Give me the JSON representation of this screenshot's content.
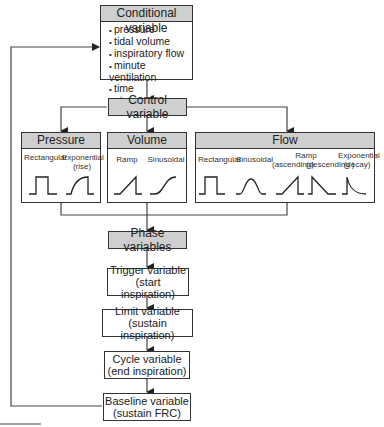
{
  "conditional": {
    "title": "Conditional variable",
    "items": [
      "pressure",
      "tidal volume",
      "inspiratory flow",
      "minute ventilation",
      "time",
      "etc."
    ]
  },
  "control": {
    "title": "Control variable"
  },
  "pressure": {
    "title": "Pressure",
    "waves": [
      {
        "label": "Rectangular",
        "shape": "rectangular"
      },
      {
        "label": "Exponential\n(rise)",
        "shape": "exponential-rise"
      }
    ]
  },
  "volume": {
    "title": "Volume",
    "waves": [
      {
        "label": "Ramp",
        "shape": "ramp"
      },
      {
        "label": "Sinusoidal",
        "shape": "sinusoidal"
      }
    ]
  },
  "flow": {
    "title": "Flow",
    "waves": [
      {
        "label": "Rectangular",
        "shape": "rectangular"
      },
      {
        "label": "Sinusoidal",
        "shape": "sinusoidal"
      },
      {
        "label": "Ramp",
        "shape": "ramp-header"
      },
      {
        "label": "(ascending)",
        "shape": "ramp-ascending"
      },
      {
        "label": "(descending )",
        "shape": "ramp-descending"
      },
      {
        "label": "Exponential",
        "shape": "exponential-decay"
      },
      {
        "label": "(decay)",
        "shape": "exponential-decay"
      }
    ]
  },
  "phase": {
    "title": "Phase variables"
  },
  "trigger": {
    "line1": "Trigger variable",
    "line2": "(start inspiration)"
  },
  "limit": {
    "line1": "Limit variable",
    "line2": "(sustain inspiration)"
  },
  "cycle": {
    "line1": "Cycle variable",
    "line2": "(end inspiration)"
  },
  "baseline": {
    "line1": "Baseline variable",
    "line2": "(sustain FRC)"
  }
}
